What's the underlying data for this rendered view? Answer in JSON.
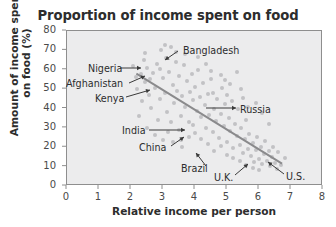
{
  "chart_data": {
    "type": "scatter",
    "title": "Proportion of income spent on food",
    "xlabel": "Relative income per person",
    "ylabel": "Amount of income spent\non food (%)",
    "xlim": [
      0,
      8
    ],
    "ylim": [
      0,
      80
    ],
    "xticks": [
      "0",
      "1",
      "2",
      "3",
      "4",
      "5",
      "6",
      "7",
      "8"
    ],
    "yticks": [
      "0",
      "10",
      "20",
      "30",
      "40",
      "50",
      "60",
      "70",
      "80"
    ],
    "grid": false,
    "legend": "none",
    "point_color": "#c2c2c4",
    "trendline_color": "#8a8a8c",
    "plot_background": "#ececed",
    "trendline": {
      "x": [
        2.2,
        6.75
      ],
      "y": [
        57.5,
        11.0
      ]
    },
    "points": [
      [
        2.05,
        62.0
      ],
      [
        2.15,
        56.5
      ],
      [
        2.2,
        50.0
      ],
      [
        2.3,
        58.0
      ],
      [
        2.35,
        44.0
      ],
      [
        2.4,
        65.0
      ],
      [
        2.45,
        53.5
      ],
      [
        2.5,
        61.0
      ],
      [
        2.55,
        47.0
      ],
      [
        2.6,
        55.0
      ],
      [
        2.62,
        40.5
      ],
      [
        2.7,
        58.5
      ],
      [
        2.75,
        50.5
      ],
      [
        2.8,
        63.0
      ],
      [
        2.85,
        34.0
      ],
      [
        2.9,
        45.0
      ],
      [
        2.95,
        70.0
      ],
      [
        3.0,
        55.5
      ],
      [
        3.05,
        48.0
      ],
      [
        3.1,
        66.0
      ],
      [
        3.12,
        38.0
      ],
      [
        3.2,
        59.0
      ],
      [
        3.25,
        71.5
      ],
      [
        3.3,
        52.0
      ],
      [
        3.35,
        43.0
      ],
      [
        3.4,
        64.0
      ],
      [
        3.45,
        49.0
      ],
      [
        3.5,
        57.0
      ],
      [
        3.55,
        36.0
      ],
      [
        3.6,
        46.5
      ],
      [
        3.65,
        62.5
      ],
      [
        3.7,
        41.0
      ],
      [
        3.75,
        54.0
      ],
      [
        3.8,
        33.0
      ],
      [
        3.85,
        48.5
      ],
      [
        3.9,
        58.0
      ],
      [
        3.95,
        44.5
      ],
      [
        4.0,
        51.0
      ],
      [
        4.05,
        38.5
      ],
      [
        4.1,
        60.0
      ],
      [
        4.15,
        46.0
      ],
      [
        4.2,
        35.5
      ],
      [
        4.25,
        53.0
      ],
      [
        4.3,
        42.0
      ],
      [
        4.35,
        30.0
      ],
      [
        4.4,
        47.5
      ],
      [
        4.45,
        36.5
      ],
      [
        4.5,
        55.0
      ],
      [
        4.55,
        28.0
      ],
      [
        4.6,
        40.0
      ],
      [
        4.65,
        33.5
      ],
      [
        4.7,
        45.0
      ],
      [
        4.75,
        25.0
      ],
      [
        4.8,
        37.0
      ],
      [
        4.85,
        50.5
      ],
      [
        4.9,
        31.0
      ],
      [
        4.95,
        42.5
      ],
      [
        5.0,
        22.5
      ],
      [
        5.05,
        35.0
      ],
      [
        5.1,
        28.5
      ],
      [
        5.15,
        44.0
      ],
      [
        5.2,
        19.5
      ],
      [
        5.25,
        32.0
      ],
      [
        5.3,
        26.0
      ],
      [
        5.35,
        39.5
      ],
      [
        5.4,
        21.0
      ],
      [
        5.45,
        30.0
      ],
      [
        5.5,
        17.0
      ],
      [
        5.55,
        24.5
      ],
      [
        5.6,
        34.0
      ],
      [
        5.65,
        19.0
      ],
      [
        5.7,
        27.0
      ],
      [
        5.75,
        15.5
      ],
      [
        5.8,
        22.0
      ],
      [
        5.85,
        12.5
      ],
      [
        5.9,
        18.5
      ],
      [
        5.95,
        25.5
      ],
      [
        6.0,
        14.0
      ],
      [
        6.05,
        20.0
      ],
      [
        6.1,
        11.5
      ],
      [
        6.15,
        16.5
      ],
      [
        6.2,
        23.0
      ],
      [
        6.25,
        13.0
      ],
      [
        6.3,
        18.0
      ],
      [
        6.35,
        10.5
      ],
      [
        6.4,
        15.0
      ],
      [
        6.5,
        12.0
      ],
      [
        6.6,
        17.5
      ],
      [
        6.7,
        11.0
      ],
      [
        6.8,
        14.5
      ],
      [
        2.25,
        36.0
      ],
      [
        2.5,
        30.0
      ],
      [
        2.75,
        26.5
      ],
      [
        3.0,
        24.0
      ],
      [
        3.15,
        28.0
      ],
      [
        3.3,
        22.5
      ],
      [
        3.5,
        29.0
      ],
      [
        3.6,
        20.0
      ],
      [
        3.8,
        25.5
      ],
      [
        4.0,
        27.5
      ],
      [
        4.2,
        24.5
      ],
      [
        4.4,
        21.5
      ],
      [
        4.6,
        18.0
      ],
      [
        4.8,
        20.5
      ],
      [
        5.0,
        16.0
      ],
      [
        5.2,
        14.5
      ],
      [
        5.4,
        13.0
      ],
      [
        5.6,
        11.0
      ],
      [
        5.8,
        9.5
      ],
      [
        6.0,
        8.5
      ],
      [
        3.05,
        73.0
      ],
      [
        3.4,
        69.0
      ],
      [
        3.7,
        68.0
      ],
      [
        4.1,
        66.5
      ],
      [
        4.5,
        59.5
      ],
      [
        4.8,
        57.5
      ],
      [
        5.1,
        52.5
      ],
      [
        5.3,
        59.0
      ],
      [
        5.5,
        45.5
      ],
      [
        5.9,
        43.0
      ],
      [
        6.1,
        37.5
      ],
      [
        6.3,
        32.0
      ],
      [
        5.45,
        50.0
      ],
      [
        5.0,
        47.0
      ],
      [
        4.35,
        63.0
      ],
      [
        2.45,
        68.5
      ],
      [
        2.9,
        60.5
      ],
      [
        3.25,
        33.0
      ],
      [
        3.55,
        23.5
      ],
      [
        3.95,
        31.5
      ],
      [
        4.55,
        48.0
      ],
      [
        4.95,
        54.5
      ],
      [
        5.65,
        41.0
      ],
      [
        6.45,
        20.0
      ],
      [
        6.55,
        9.0
      ]
    ],
    "annotations": [
      {
        "label": "Bangladesh",
        "text_x": 183,
        "text_y": 46,
        "line": [
          178,
          51,
          165,
          60
        ]
      },
      {
        "label": "Nigeria",
        "text_x": 88,
        "text_y": 64,
        "line": [
          120,
          68,
          141,
          68
        ]
      },
      {
        "label": "Afghanistan",
        "text_x": 66,
        "text_y": 79,
        "line": [
          129,
          83,
          145,
          76
        ]
      },
      {
        "label": "Kenya",
        "text_x": 95,
        "text_y": 94,
        "line": [
          126,
          97,
          150,
          90
        ]
      },
      {
        "label": "Russia",
        "text_x": 240,
        "text_y": 105,
        "line": [
          206,
          108,
          236,
          108
        ]
      },
      {
        "label": "India",
        "text_x": 122,
        "text_y": 126,
        "line": [
          149,
          130,
          185,
          130
        ]
      },
      {
        "label": "China",
        "text_x": 139,
        "text_y": 143,
        "line": [
          171,
          146,
          184,
          137
        ]
      },
      {
        "label": "Brazil",
        "text_x": 181,
        "text_y": 164,
        "line": [
          206,
          166,
          196,
          153
        ]
      },
      {
        "label": "U.K.",
        "text_x": 214,
        "text_y": 173,
        "line": [
          235,
          175,
          248,
          164
        ]
      },
      {
        "label": "U.S.",
        "text_x": 286,
        "text_y": 172,
        "line": [
          284,
          174,
          268,
          162
        ]
      }
    ]
  }
}
